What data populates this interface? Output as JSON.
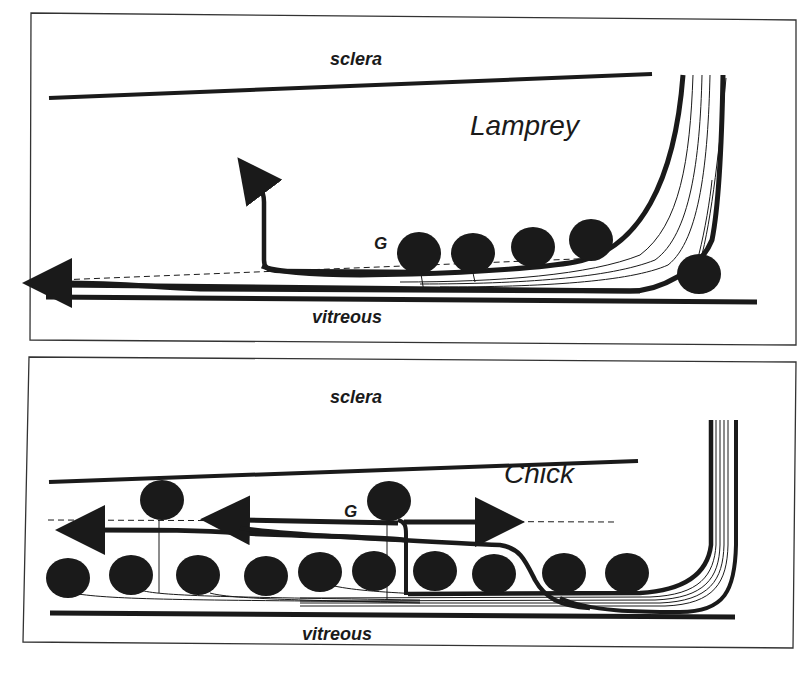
{
  "figure": {
    "panels": [
      {
        "id": "lamprey",
        "species_label": "Lamprey",
        "top_label": "sclera",
        "bottom_label": "vitreous",
        "cell_marker_label": "G"
      },
      {
        "id": "chick",
        "species_label": "Chick",
        "top_label": "sclera",
        "bottom_label": "vitreous",
        "cell_marker_label": "G"
      }
    ],
    "colors": {
      "ink": "#1a1a1a",
      "background": "#ffffff",
      "frame": "#333333"
    }
  }
}
